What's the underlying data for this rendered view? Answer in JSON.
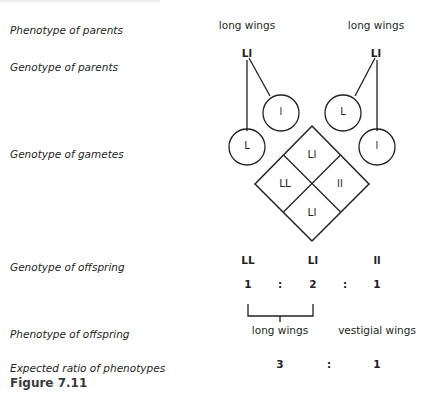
{
  "labels": {
    "phenotype_parents": "Phenotype of parents",
    "genotype_parents": "Genotype of parents",
    "genotype_gametes": "Genotype of gametes",
    "genotype_offspring": "Genotype of offspring",
    "phenotype_offspring": "Phenotype of offspring",
    "expected_ratio": "Expected ratio of phenotypes"
  },
  "parents": [
    {
      "phenotype": "long wings",
      "genotype": "Ll"
    },
    {
      "phenotype": "long wings",
      "genotype": "Ll"
    }
  ],
  "gametes": [
    "L",
    "l",
    "L",
    "l"
  ],
  "punnett": {
    "top": "Ll",
    "left": "LL",
    "right": "ll",
    "bottom": "Ll"
  },
  "offspring": {
    "genotypes": [
      "LL",
      "Ll",
      "ll"
    ],
    "ratio": [
      "1",
      ":",
      "2",
      ":",
      "1"
    ],
    "phenotypes": [
      "long wings",
      "vestigial wings"
    ],
    "phenotype_ratio": [
      "3",
      ":",
      "1"
    ]
  },
  "caption": "Figure 7.11"
}
